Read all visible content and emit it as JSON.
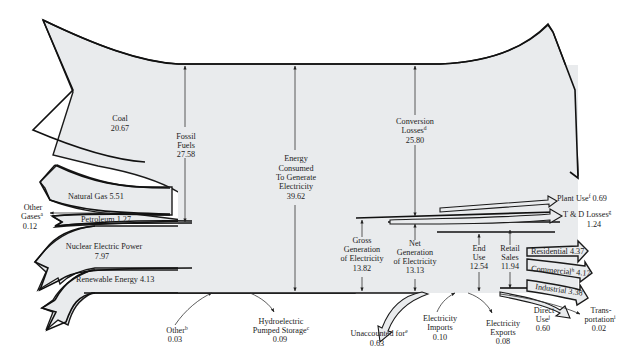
{
  "diagram": {
    "sources": {
      "coal": {
        "label": "Coal",
        "value": "20.67"
      },
      "natural_gas": {
        "label": "Natural Gas",
        "value": "5.51"
      },
      "petroleum": {
        "label": "Petroleum",
        "value": "1.27"
      },
      "other_gases": {
        "label_line1": "Other",
        "label_line2": "Gases",
        "note": "a",
        "value": "0.12"
      },
      "nuclear": {
        "label": "Nuclear Electric Power",
        "value": "7.97"
      },
      "renewable": {
        "label": "Renewable Energy",
        "value": "4.13"
      }
    },
    "fossil_fuels": {
      "label_line1": "Fossil",
      "label_line2": "Fuels",
      "value": "27.58"
    },
    "energy_consumed": {
      "label_line1": "Energy",
      "label_line2": "Consumed",
      "label_line3": "To Generate",
      "label_line4": "Electricity",
      "value": "39.62"
    },
    "conversion_losses": {
      "label_line1": "Conversion",
      "label_line2": "Losses",
      "note": "d",
      "value": "25.80"
    },
    "other_input": {
      "label": "Other",
      "note": "b",
      "value": "0.03"
    },
    "hydro_pumped": {
      "label_line1": "Hydroelectric",
      "label_line2": "Pumped Storage",
      "note": "c",
      "value": "0.09"
    },
    "gross_generation": {
      "label_line1": "Gross",
      "label_line2": "Generation",
      "label_line3": "of Electricity",
      "value": "13.82"
    },
    "net_generation": {
      "label_line1": "Net",
      "label_line2": "Generation",
      "label_line3": "of Electricity",
      "value": "13.13"
    },
    "plant_use": {
      "label": "Plant Use",
      "note": "f",
      "value": "0.69"
    },
    "td_losses": {
      "label": "T & D Losses",
      "note": "g",
      "value": "1.24"
    },
    "unaccounted": {
      "label": "Unaccounted for",
      "note": "e",
      "value": "0.63"
    },
    "imports": {
      "label_line1": "Electricity",
      "label_line2": "Imports",
      "value": "0.10"
    },
    "exports": {
      "label_line1": "Electricity",
      "label_line2": "Exports",
      "value": "0.08"
    },
    "end_use": {
      "label_line1": "End",
      "label_line2": "Use",
      "value": "12.54"
    },
    "retail_sales": {
      "label_line1": "Retail",
      "label_line2": "Sales",
      "value": "11.94"
    },
    "residential": {
      "label": "Residential",
      "value": "4.37"
    },
    "commercial": {
      "label": "Commercial",
      "note": "h",
      "value": "4.17"
    },
    "industrial": {
      "label": "Industrial",
      "value": "3.38"
    },
    "direct_use": {
      "label_line1": "Direct",
      "label_line2": "Use",
      "note": "j",
      "value": "0.60"
    },
    "transportation": {
      "label_line1": "Trans-",
      "label_line2": "portation",
      "note": "i",
      "value": "0.02"
    }
  },
  "colors": {
    "flow_fill": "#e9ebed",
    "stroke": "#1a1a1a",
    "background": "#ffffff"
  }
}
